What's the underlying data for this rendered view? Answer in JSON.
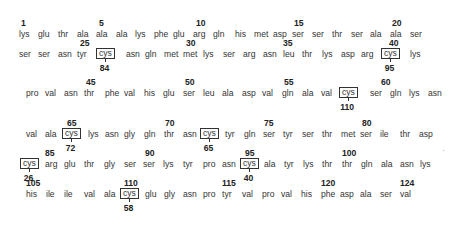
{
  "rows": [
    {
      "y": 28,
      "residues": [
        "lys",
        "glu",
        "thr",
        "ala",
        "ala",
        "ala",
        "lys",
        "phe",
        "glu",
        "arg",
        "gln",
        "his",
        "met",
        "asp",
        "ser",
        "ser",
        "thr",
        "ser",
        "ala",
        "ala",
        "ser"
      ],
      "x": [
        19,
        38,
        58,
        77,
        96,
        116,
        135,
        154,
        173,
        193,
        213,
        235,
        254,
        273,
        292,
        312,
        332,
        351,
        370,
        390,
        410
      ],
      "boxed": [],
      "numbers": [
        {
          "label": "1",
          "x": 21
        },
        {
          "label": "5",
          "x": 99
        },
        {
          "label": "10",
          "x": 196
        },
        {
          "label": "15",
          "x": 294
        },
        {
          "label": "20",
          "x": 392
        }
      ],
      "bridges": []
    },
    {
      "y": 48,
      "residues": [
        "ser",
        "ser",
        "asn",
        "tyr",
        "cys",
        "asn",
        "gln",
        "met",
        "met",
        "lys",
        "ser",
        "arg",
        "asn",
        "leu",
        "thr",
        "lys",
        "asp",
        "arg",
        "cys",
        "lys"
      ],
      "x": [
        19,
        38,
        58,
        77,
        96,
        126,
        145,
        164,
        183,
        203,
        223,
        243,
        263,
        283,
        302,
        322,
        341,
        361,
        381,
        410
      ],
      "boxed": [
        4,
        18
      ],
      "numbers": [
        {
          "label": "25",
          "x": 80
        },
        {
          "label": "30",
          "x": 186
        },
        {
          "label": "35",
          "x": 283
        },
        {
          "label": "40",
          "x": 389
        }
      ],
      "bridges": [
        {
          "label": "84",
          "index": 4
        },
        {
          "label": "95",
          "index": 18
        }
      ]
    },
    {
      "y": 87,
      "residues": [
        "pro",
        "val",
        "asn",
        "thr",
        "phe",
        "val",
        "his",
        "glu",
        "ser",
        "leu",
        "ala",
        "asp",
        "val",
        "gln",
        "ala",
        "val",
        "cys",
        "ser",
        "gln",
        "lys",
        "asn"
      ],
      "x": [
        26,
        45,
        64,
        84,
        105,
        124,
        144,
        163,
        183,
        203,
        222,
        242,
        262,
        282,
        302,
        321,
        339,
        370,
        390,
        409,
        428
      ],
      "boxed": [
        16
      ],
      "numbers": [
        {
          "label": "45",
          "x": 86
        },
        {
          "label": "50",
          "x": 185
        },
        {
          "label": "55",
          "x": 284
        },
        {
          "label": "60",
          "x": 381
        }
      ],
      "bridges": [
        {
          "label": "110",
          "index": 16
        }
      ]
    },
    {
      "y": 128,
      "residues": [
        "val",
        "ala",
        "cys",
        "lys",
        "asn",
        "gly",
        "gln",
        "thr",
        "asn",
        "cys",
        "tyr",
        "gln",
        "ser",
        "tyr",
        "ser",
        "thr",
        "met",
        "ser",
        "ile",
        "thr",
        "asp"
      ],
      "x": [
        26,
        45,
        62,
        88,
        105,
        124,
        144,
        164,
        183,
        200,
        225,
        244,
        263,
        283,
        302,
        322,
        341,
        360,
        380,
        400,
        419
      ],
      "boxed": [
        2,
        9
      ],
      "numbers": [
        {
          "label": "65",
          "x": 67
        },
        {
          "label": "70",
          "x": 165
        },
        {
          "label": "75",
          "x": 264
        },
        {
          "label": "80",
          "x": 362
        }
      ],
      "bridges": [
        {
          "label": "72",
          "index": 2
        },
        {
          "label": "65",
          "index": 9
        }
      ]
    },
    {
      "y": 158,
      "residues": [
        "cys",
        "arg",
        "glu",
        "thr",
        "gly",
        "ser",
        "ser",
        "lys",
        "tyr",
        "pro",
        "asn",
        "cys",
        "ala",
        "tyr",
        "lys",
        "thr",
        "thr",
        "gln",
        "ala",
        "asn",
        "lys"
      ],
      "x": [
        20,
        45,
        64,
        84,
        104,
        124,
        143,
        163,
        183,
        203,
        222,
        240,
        264,
        284,
        303,
        322,
        342,
        361,
        381,
        400,
        420
      ],
      "boxed": [
        0,
        11
      ],
      "numbers": [
        {
          "label": "85",
          "x": 45
        },
        {
          "label": "90",
          "x": 145
        },
        {
          "label": "95",
          "x": 245
        },
        {
          "label": "100",
          "x": 342
        }
      ],
      "bridges": [
        {
          "label": "26",
          "index": 0
        },
        {
          "label": "40",
          "index": 11
        }
      ]
    },
    {
      "y": 188,
      "residues": [
        "his",
        "ile",
        "ile",
        "val",
        "ala",
        "cys",
        "glu",
        "gly",
        "asn",
        "pro",
        "tyr",
        "val",
        "pro",
        "val",
        "his",
        "phe",
        "asp",
        "ala",
        "ser",
        "val"
      ],
      "x": [
        26,
        46,
        64,
        84,
        104,
        120,
        145,
        164,
        183,
        203,
        222,
        242,
        262,
        281,
        301,
        321,
        340,
        360,
        380,
        400
      ],
      "boxed": [
        5
      ],
      "numbers": [
        {
          "label": "105",
          "x": 26
        },
        {
          "label": "110",
          "x": 124
        },
        {
          "label": "115",
          "x": 222
        },
        {
          "label": "120",
          "x": 321
        },
        {
          "label": "124",
          "x": 400
        }
      ],
      "bridges": [
        {
          "label": "58",
          "index": 5
        }
      ]
    }
  ]
}
